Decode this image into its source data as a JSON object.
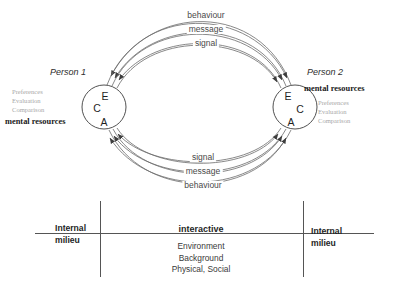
{
  "diagram": {
    "accent_color": "#555555",
    "muted_color": "#a8a8a8"
  },
  "channels": {
    "top": [
      {
        "id": "top-behaviour",
        "label": "behaviour"
      },
      {
        "id": "top-message",
        "label": "message"
      },
      {
        "id": "top-signal",
        "label": "signal"
      }
    ],
    "bottom": [
      {
        "id": "bottom-signal",
        "label": "signal"
      },
      {
        "id": "bottom-message",
        "label": "message"
      },
      {
        "id": "bottom-behaviour",
        "label": "behaviour"
      }
    ]
  },
  "persons": [
    {
      "id": "person-1",
      "title": "Person 1",
      "mental_resources_label": "mental resources",
      "attributes": [
        "Preferences",
        "Evaluation",
        "Comparison"
      ],
      "circle_letters": [
        "E",
        "C",
        "A"
      ]
    },
    {
      "id": "person-2",
      "title": "Person 2",
      "mental_resources_label": "mental resources",
      "attributes": [
        "Preferences",
        "Evaluation",
        "Comparison"
      ],
      "circle_letters": [
        "E",
        "C",
        "A"
      ]
    }
  ],
  "band": {
    "left": {
      "line1": "Internal",
      "line2": "milieu"
    },
    "right": {
      "line1": "Internal",
      "line2": "milieu"
    },
    "center": {
      "heading": "interactive",
      "items": [
        "Environment",
        "Background",
        "Physical, Social"
      ]
    }
  }
}
